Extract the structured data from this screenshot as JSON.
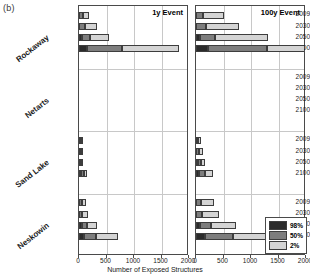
{
  "figure": {
    "panel_label": "(b)",
    "xlabel": "Number of Exposed Structures"
  },
  "legend": {
    "position": "bottom-right",
    "items": [
      {
        "label": "98%",
        "color": "#2b2b2b"
      },
      {
        "label": "50%",
        "color": "#7d7d7d"
      },
      {
        "label": "2%",
        "color": "#d4d4d4"
      }
    ]
  },
  "axis": {
    "xticks": [
      0,
      500,
      1000,
      1500,
      2000
    ],
    "xlim": [
      0,
      2000
    ],
    "grid": true,
    "years": [
      "2009",
      "2030",
      "2050",
      "2100"
    ],
    "groups": [
      "Rockaway",
      "Netarts",
      "Sand Lake",
      "Neskowin"
    ]
  },
  "chart_data": {
    "type": "bar",
    "subtitle": "(b)",
    "orientation": "horizontal",
    "stacked": true,
    "xlabel": "Number of Exposed Structures",
    "ylabel": "",
    "xlim": [
      0,
      2000
    ],
    "xticks": [
      0,
      500,
      1000,
      1500,
      2000
    ],
    "grid": true,
    "legend_position": "bottom-right",
    "series": [
      {
        "name": "98%",
        "color": "#2b2b2b"
      },
      {
        "name": "50%",
        "color": "#7d7d7d"
      },
      {
        "name": "2%",
        "color": "#d4d4d4"
      }
    ],
    "panels": [
      {
        "title": "1y Event",
        "groups": [
          {
            "name": "Rockaway",
            "rows": [
              {
                "year": "2009",
                "values": {
                  "98%": 0,
                  "50%": 60,
                  "2%": 130
                }
              },
              {
                "year": "2030",
                "values": {
                  "98%": 0,
                  "50%": 90,
                  "2%": 230
                }
              },
              {
                "year": "2050",
                "values": {
                  "98%": 30,
                  "50%": 130,
                  "2%": 380
                }
              },
              {
                "year": "2100",
                "values": {
                  "98%": 120,
                  "50%": 640,
                  "2%": 1050
                }
              }
            ]
          },
          {
            "name": "Netarts",
            "rows": [
              {
                "year": "2009",
                "values": {
                  "98%": 0,
                  "50%": 0,
                  "2%": 0
                }
              },
              {
                "year": "2030",
                "values": {
                  "98%": 0,
                  "50%": 0,
                  "2%": 0
                }
              },
              {
                "year": "2050",
                "values": {
                  "98%": 0,
                  "50%": 0,
                  "2%": 0
                }
              },
              {
                "year": "2100",
                "values": {
                  "98%": 0,
                  "50%": 0,
                  "2%": 0
                }
              }
            ]
          },
          {
            "name": "Sand Lake",
            "rows": [
              {
                "year": "2009",
                "values": {
                  "98%": 0,
                  "50%": 20,
                  "2%": 25
                }
              },
              {
                "year": "2030",
                "values": {
                  "98%": 0,
                  "50%": 20,
                  "2%": 30
                }
              },
              {
                "year": "2050",
                "values": {
                  "98%": 0,
                  "50%": 25,
                  "2%": 40
                }
              },
              {
                "year": "2100",
                "values": {
                  "98%": 20,
                  "50%": 50,
                  "2%": 70
                }
              }
            ]
          },
          {
            "name": "Neskowin",
            "rows": [
              {
                "year": "2009",
                "values": {
                  "98%": 0,
                  "50%": 30,
                  "2%": 100
                }
              },
              {
                "year": "2030",
                "values": {
                  "98%": 0,
                  "50%": 40,
                  "2%": 120
                }
              },
              {
                "year": "2050",
                "values": {
                  "98%": 20,
                  "50%": 100,
                  "2%": 215
                }
              },
              {
                "year": "2100",
                "values": {
                  "98%": 70,
                  "50%": 215,
                  "2%": 420
                }
              }
            ]
          }
        ]
      },
      {
        "title": "100y Event",
        "groups": [
          {
            "name": "Rockaway",
            "rows": [
              {
                "year": "2009",
                "values": {
                  "98%": 0,
                  "50%": 110,
                  "2%": 400
                }
              },
              {
                "year": "2030",
                "values": {
                  "98%": 0,
                  "50%": 170,
                  "2%": 620
                }
              },
              {
                "year": "2050",
                "values": {
                  "98%": 40,
                  "50%": 260,
                  "2%": 1010
                }
              },
              {
                "year": "2100",
                "values": {
                  "98%": 180,
                  "50%": 1080,
                  "2%": 1820
                }
              }
            ]
          },
          {
            "name": "Netarts",
            "rows": [
              {
                "year": "2009",
                "values": {
                  "98%": 0,
                  "50%": 0,
                  "2%": 0
                }
              },
              {
                "year": "2030",
                "values": {
                  "98%": 0,
                  "50%": 0,
                  "2%": 0
                }
              },
              {
                "year": "2050",
                "values": {
                  "98%": 0,
                  "50%": 0,
                  "2%": 0
                }
              },
              {
                "year": "2100",
                "values": {
                  "98%": 0,
                  "50%": 0,
                  "2%": 0
                }
              }
            ]
          },
          {
            "name": "Sand Lake",
            "rows": [
              {
                "year": "2009",
                "values": {
                  "98%": 0,
                  "50%": 30,
                  "2%": 60
                }
              },
              {
                "year": "2030",
                "values": {
                  "98%": 0,
                  "50%": 40,
                  "2%": 80
                }
              },
              {
                "year": "2050",
                "values": {
                  "98%": 10,
                  "50%": 50,
                  "2%": 110
                }
              },
              {
                "year": "2100",
                "values": {
                  "98%": 40,
                  "50%": 90,
                  "2%": 175
                }
              }
            ]
          },
          {
            "name": "Neskowin",
            "rows": [
              {
                "year": "2009",
                "values": {
                  "98%": 0,
                  "50%": 60,
                  "2%": 265
                }
              },
              {
                "year": "2030",
                "values": {
                  "98%": 0,
                  "50%": 90,
                  "2%": 330
                }
              },
              {
                "year": "2050",
                "values": {
                  "98%": 40,
                  "50%": 200,
                  "2%": 490
                }
              },
              {
                "year": "2100",
                "values": {
                  "98%": 130,
                  "50%": 520,
                  "2%": 830
                }
              }
            ]
          }
        ]
      }
    ]
  }
}
